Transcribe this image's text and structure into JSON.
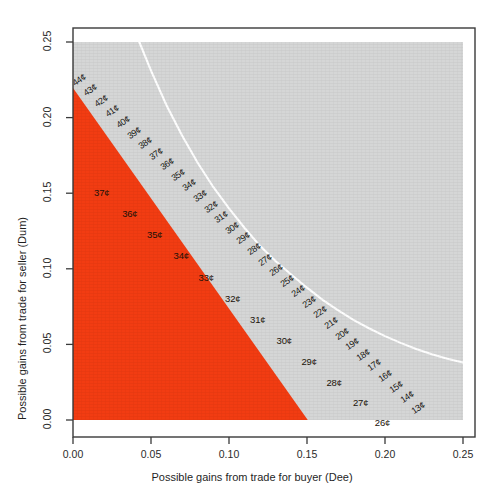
{
  "chart_data": {
    "type": "area",
    "title": "",
    "subtitle": "",
    "xlabel": "Possible gains from trade for buyer (Dee)",
    "ylabel": "Possible gains from trade for seller (Dum)",
    "xlim": [
      0.0,
      0.25
    ],
    "ylim": [
      0.0,
      0.25
    ],
    "xticks": [
      "0.00",
      "0.05",
      "0.10",
      "0.15",
      "0.20",
      "0.25"
    ],
    "yticks": [
      "0.00",
      "0.05",
      "0.10",
      "0.15",
      "0.20",
      "0.25"
    ],
    "xtick_values": [
      0.0,
      0.05,
      0.1,
      0.15,
      0.2,
      0.25
    ],
    "ytick_values": [
      0.0,
      0.05,
      0.1,
      0.15,
      0.2,
      0.25
    ],
    "grid": false,
    "legend_position": "none",
    "colors": {
      "feasible_region": "#F23C12",
      "background_region": "#D5D6D6",
      "contour_curve": "#FFFFFF",
      "frame": "#3a3a3a",
      "label_text": "#1b1b1b",
      "page": "#FFFFFF"
    },
    "regions": [
      {
        "name": "background-region",
        "description": "Light gray plotting background covering the full axes area",
        "fill": "#D5D6D6",
        "x_range": [
          0.0,
          0.25
        ],
        "y_range": [
          0.0,
          0.25
        ]
      },
      {
        "name": "feasible-trade-region",
        "description": "Orange region of mutually beneficial trades (gains from trade frontier)",
        "fill": "#F23C12",
        "vertices": [
          [
            0.0,
            0.0
          ],
          [
            0.0,
            0.2195
          ],
          [
            0.1505,
            0.0
          ]
        ]
      }
    ],
    "frontier": {
      "name": "gains-from-trade-frontier",
      "description": "Upper-right linear boundary of the orange feasible region",
      "endpoints": [
        [
          0.0,
          0.2195
        ],
        [
          0.1505,
          0.0
        ]
      ]
    },
    "contour_curve": {
      "name": "white-contour-curve",
      "description": "White hyperbolic iso-curve crossing the gray region from top edge to right edge",
      "stroke": "#FFFFFF",
      "stroke_width": 2,
      "points": [
        [
          0.0425,
          0.25
        ],
        [
          0.05,
          0.231
        ],
        [
          0.06,
          0.208
        ],
        [
          0.07,
          0.188
        ],
        [
          0.08,
          0.17
        ],
        [
          0.09,
          0.154
        ],
        [
          0.1,
          0.14
        ],
        [
          0.11,
          0.127
        ],
        [
          0.12,
          0.115
        ],
        [
          0.13,
          0.105
        ],
        [
          0.14,
          0.096
        ],
        [
          0.15,
          0.0875
        ],
        [
          0.16,
          0.0795
        ],
        [
          0.17,
          0.0725
        ],
        [
          0.18,
          0.066
        ],
        [
          0.19,
          0.0605
        ],
        [
          0.2,
          0.0555
        ],
        [
          0.21,
          0.051
        ],
        [
          0.22,
          0.047
        ],
        [
          0.23,
          0.0435
        ],
        [
          0.24,
          0.0405
        ],
        [
          0.25,
          0.038
        ]
      ]
    },
    "boundary_labels": {
      "name": "frontier-price-labels",
      "description": "Price labels in cents placed along the frontier, descending from 44 to 13",
      "values": [
        {
          "text": "44¢",
          "x": 0.0035,
          "y": 0.2185
        },
        {
          "text": "43¢",
          "x": 0.0105,
          "y": 0.2115
        },
        {
          "text": "42¢",
          "x": 0.0175,
          "y": 0.2045
        },
        {
          "text": "41¢",
          "x": 0.0245,
          "y": 0.1975
        },
        {
          "text": "40¢",
          "x": 0.0315,
          "y": 0.1905
        },
        {
          "text": "39¢",
          "x": 0.0385,
          "y": 0.1835
        },
        {
          "text": "38¢",
          "x": 0.0455,
          "y": 0.1765
        },
        {
          "text": "37¢",
          "x": 0.0525,
          "y": 0.1695
        },
        {
          "text": "36¢",
          "x": 0.0595,
          "y": 0.1625
        },
        {
          "text": "35¢",
          "x": 0.0665,
          "y": 0.1555
        },
        {
          "text": "34¢",
          "x": 0.0735,
          "y": 0.1485
        },
        {
          "text": "33¢",
          "x": 0.0805,
          "y": 0.1415
        },
        {
          "text": "32¢",
          "x": 0.0875,
          "y": 0.1345
        },
        {
          "text": "31¢",
          "x": 0.0945,
          "y": 0.1275
        },
        {
          "text": "30¢",
          "x": 0.1015,
          "y": 0.1205
        },
        {
          "text": "29¢",
          "x": 0.1085,
          "y": 0.1135
        },
        {
          "text": "28¢",
          "x": 0.1155,
          "y": 0.1065
        },
        {
          "text": "27¢",
          "x": 0.1225,
          "y": 0.0995
        },
        {
          "text": "26¢",
          "x": 0.1295,
          "y": 0.0925
        },
        {
          "text": "25¢",
          "x": 0.1365,
          "y": 0.0855
        },
        {
          "text": "24¢",
          "x": 0.1435,
          "y": 0.0785
        },
        {
          "text": "23¢",
          "x": 0.1505,
          "y": 0.0715
        },
        {
          "text": "22¢",
          "x": 0.1575,
          "y": 0.0645
        },
        {
          "text": "21¢",
          "x": 0.1645,
          "y": 0.0575
        },
        {
          "text": "20¢",
          "x": 0.1715,
          "y": 0.0505
        },
        {
          "text": "19¢",
          "x": 0.1785,
          "y": 0.0435
        },
        {
          "text": "18¢",
          "x": 0.1855,
          "y": 0.0365
        },
        {
          "text": "17¢",
          "x": 0.1925,
          "y": 0.0295
        },
        {
          "text": "16¢",
          "x": 0.1995,
          "y": 0.0225
        },
        {
          "text": "15¢",
          "x": 0.2065,
          "y": 0.0155
        },
        {
          "text": "14¢",
          "x": 0.2135,
          "y": 0.0085
        },
        {
          "text": "13¢",
          "x": 0.2205,
          "y": 0.0015
        }
      ]
    },
    "inner_labels": {
      "name": "interior-price-labels",
      "description": "Price labels in cents placed inside the orange feasible region, descending from 37 to 26",
      "values": [
        {
          "text": "37¢",
          "x": 0.0135,
          "y": 0.1495
        },
        {
          "text": "36¢",
          "x": 0.0315,
          "y": 0.1355
        },
        {
          "text": "35¢",
          "x": 0.0475,
          "y": 0.1215
        },
        {
          "text": "34¢",
          "x": 0.0645,
          "y": 0.1075
        },
        {
          "text": "33¢",
          "x": 0.0805,
          "y": 0.0935
        },
        {
          "text": "32¢",
          "x": 0.0975,
          "y": 0.0795
        },
        {
          "text": "31¢",
          "x": 0.1135,
          "y": 0.0655
        },
        {
          "text": "30¢",
          "x": 0.1305,
          "y": 0.0515
        },
        {
          "text": "29¢",
          "x": 0.1465,
          "y": 0.0375
        },
        {
          "text": "28¢",
          "x": 0.1625,
          "y": 0.0235
        },
        {
          "text": "27¢",
          "x": 0.1795,
          "y": 0.0105
        },
        {
          "text": "26¢",
          "x": 0.1935,
          "y": -0.0025
        }
      ]
    }
  }
}
